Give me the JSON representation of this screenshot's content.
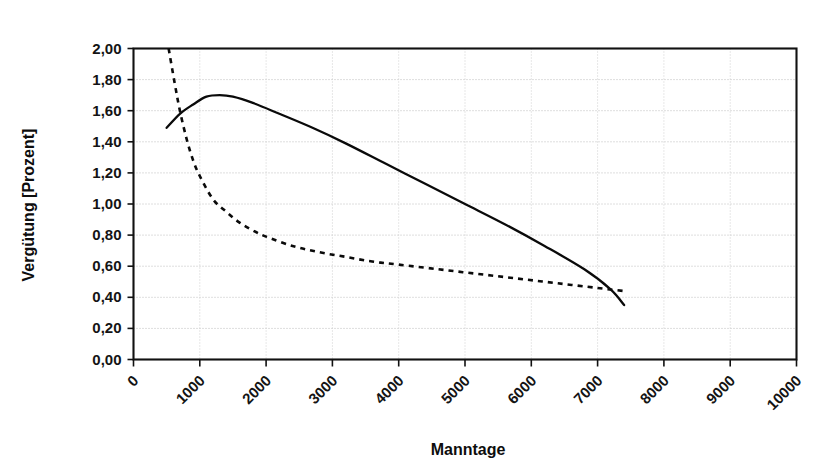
{
  "chart_data": {
    "type": "line",
    "title": "",
    "xlabel": "Manntage",
    "ylabel": "Vergütung [Prozent]",
    "xlim": [
      0,
      10000
    ],
    "ylim": [
      0,
      2.0
    ],
    "grid": true,
    "legend": "none",
    "x_ticks": [
      "0",
      "1000",
      "2000",
      "3000",
      "4000",
      "5000",
      "6000",
      "7000",
      "8000",
      "9000",
      "10000"
    ],
    "x_tick_values": [
      0,
      1000,
      2000,
      3000,
      4000,
      5000,
      6000,
      7000,
      8000,
      9000,
      10000
    ],
    "y_ticks": [
      "0,00",
      "0,20",
      "0,40",
      "0,60",
      "0,80",
      "1,00",
      "1,20",
      "1,40",
      "1,60",
      "1,80",
      "2,00"
    ],
    "y_tick_values": [
      0.0,
      0.2,
      0.4,
      0.6,
      0.8,
      1.0,
      1.2,
      1.4,
      1.6,
      1.8,
      2.0
    ],
    "series": [
      {
        "name": "solid-curve",
        "style": "solid",
        "color": "#0a0a0a",
        "x": [
          500,
          700,
          900,
          1100,
          1300,
          1500,
          1800,
          2200,
          2700,
          3200,
          3800,
          4400,
          5000,
          5600,
          6200,
          6800,
          7200,
          7400
        ],
        "values": [
          1.49,
          1.58,
          1.64,
          1.69,
          1.7,
          1.69,
          1.65,
          1.58,
          1.49,
          1.39,
          1.26,
          1.13,
          1.0,
          0.87,
          0.73,
          0.58,
          0.45,
          0.35
        ]
      },
      {
        "name": "dashed-curve",
        "style": "dashed",
        "color": "#0a0a0a",
        "x": [
          530,
          620,
          700,
          800,
          900,
          1000,
          1200,
          1400,
          1600,
          1800,
          2000,
          2400,
          2800,
          3200,
          3600,
          4000,
          4600,
          5200,
          5800,
          6400,
          7000,
          7400
        ],
        "values": [
          2.0,
          1.78,
          1.6,
          1.42,
          1.28,
          1.18,
          1.03,
          0.95,
          0.88,
          0.83,
          0.79,
          0.73,
          0.69,
          0.66,
          0.63,
          0.61,
          0.58,
          0.55,
          0.52,
          0.49,
          0.46,
          0.44
        ]
      }
    ]
  },
  "axis": {
    "x_title": "Manntage",
    "y_title": "Vergütung [Prozent]"
  },
  "colors": {
    "line": "#0a0a0a",
    "grid": "#bdbdbd",
    "frame": "#111111",
    "background": "#ffffff"
  }
}
